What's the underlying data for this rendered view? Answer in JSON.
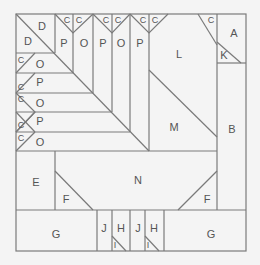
{
  "diagram": {
    "type": "quilt-block-pattern",
    "background": "#f4f4f4",
    "block_fill": "#ffffff",
    "line_color": "#7a7a7a",
    "label_color": "#555555",
    "labels": {
      "A": "A",
      "B": "B",
      "C": "C",
      "D": "D",
      "E": "E",
      "F": "F",
      "G": "G",
      "H": "H",
      "I": "I",
      "J": "J",
      "K": "K",
      "L": "L",
      "M": "M",
      "N": "N",
      "O": "O",
      "P": "P"
    },
    "pieces": [
      {
        "label": "D",
        "count": 2
      },
      {
        "label": "P",
        "count": 6
      },
      {
        "label": "O",
        "count": 6
      },
      {
        "label": "C",
        "count": 13
      },
      {
        "label": "L",
        "count": 1
      },
      {
        "label": "M",
        "count": 1
      },
      {
        "label": "A",
        "count": 1
      },
      {
        "label": "K",
        "count": 1
      },
      {
        "label": "B",
        "count": 1
      },
      {
        "label": "N",
        "count": 1
      },
      {
        "label": "E",
        "count": 1
      },
      {
        "label": "F",
        "count": 2
      },
      {
        "label": "G",
        "count": 2
      },
      {
        "label": "J",
        "count": 2
      },
      {
        "label": "H",
        "count": 2
      },
      {
        "label": "I",
        "count": 2
      }
    ]
  }
}
